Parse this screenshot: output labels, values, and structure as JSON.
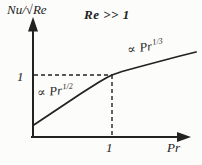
{
  "figure": {
    "paper_color": "#fcfcfa",
    "ink_color": "#222222",
    "title": "Re >> 1",
    "y_axis_label": "Nu/√Re",
    "x_axis_label": "Pr",
    "y_tick": "1",
    "x_tick": "1",
    "annotations": {
      "low_pr": {
        "symbol": "∝",
        "base": "Pr",
        "exponent": "1/2"
      },
      "high_pr": {
        "symbol": "∝",
        "base": "Pr",
        "exponent": "1/3"
      }
    }
  },
  "chart_data": {
    "type": "line",
    "title": "Re >> 1",
    "xlabel": "Pr",
    "ylabel": "Nu/√Re",
    "x_ticks": [
      "1"
    ],
    "y_ticks": [
      "1"
    ],
    "grid": false,
    "legend": "none",
    "axes_style": "qualitative sketch, arrow-terminated axes",
    "guides_note": "dashed horizontal and vertical lines meet the curve at (Pr=1, Nu/√Re=1)",
    "reference_point": {
      "x": 1,
      "y": 1
    },
    "regimes": [
      {
        "domain": "Pr < 1",
        "relation": "Nu/√Re ∝ Pr^(1/2)"
      },
      {
        "domain": "Pr > 1",
        "relation": "Nu/√Re ∝ Pr^(1/3)"
      }
    ],
    "curve_points_px": [
      [
        33,
        125.5
      ],
      [
        45,
        117.5
      ],
      [
        57,
        109.5
      ],
      [
        69,
        101.5
      ],
      [
        81,
        93.5
      ],
      [
        92,
        86.5
      ],
      [
        100,
        81.5
      ],
      [
        107,
        77.5
      ],
      [
        112,
        75
      ],
      [
        122,
        71.5
      ],
      [
        133,
        68.5
      ],
      [
        146,
        65
      ],
      [
        161,
        61
      ],
      [
        178,
        56.5
      ],
      [
        196,
        52
      ]
    ],
    "guides_px": {
      "horizontal": [
        [
          34,
          75
        ],
        [
          112,
          75
        ]
      ],
      "vertical": [
        [
          112,
          75
        ],
        [
          112,
          136
        ]
      ]
    }
  }
}
